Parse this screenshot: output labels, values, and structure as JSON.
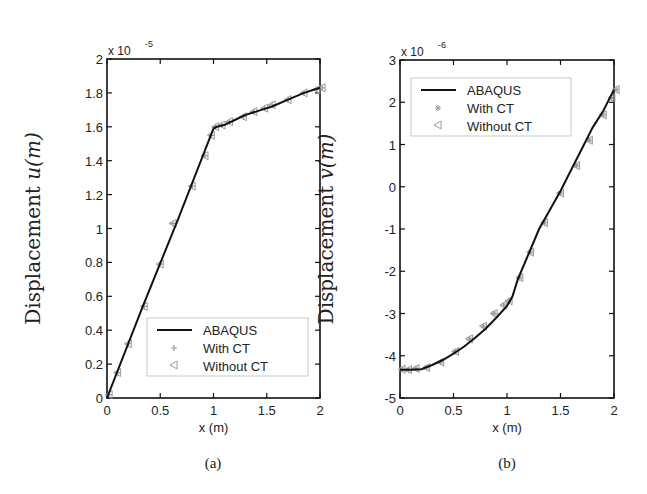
{
  "chart_data": [
    {
      "type": "line",
      "panel": "(a)",
      "title": "",
      "xlabel": "x (m)",
      "ylabel": "Displacement u(m)",
      "ylabel_text": "Displacement ",
      "ylabel_var": "u(m)",
      "y_multiplier": "x 10",
      "y_multiplier_exp": "-5",
      "xlim": [
        0,
        2
      ],
      "ylim": [
        0,
        2
      ],
      "xticks": [
        0,
        0.5,
        1,
        1.5,
        2
      ],
      "xtick_labels": [
        "0",
        "0.5",
        "1",
        "1.5",
        "2"
      ],
      "yticks": [
        0,
        0.2,
        0.4,
        0.6,
        0.8,
        1,
        1.2,
        1.4,
        1.6,
        1.8,
        2
      ],
      "ytick_labels": [
        "0",
        "0.2",
        "0.4",
        "0.6",
        "0.8",
        "1",
        "1.2",
        "1.4",
        "1.6",
        "1.8",
        "2"
      ],
      "grid": false,
      "legend_position": "lower right",
      "series": [
        {
          "name": "ABAQUS",
          "style": "solid-line",
          "x": [
            0,
            0.33,
            0.67,
            1.0,
            1.03,
            1.1,
            1.2,
            1.3,
            1.45,
            1.55,
            1.7,
            1.85,
            2.0
          ],
          "y": [
            0,
            0.53,
            1.06,
            1.59,
            1.6,
            1.61,
            1.64,
            1.67,
            1.7,
            1.72,
            1.76,
            1.8,
            1.83
          ]
        },
        {
          "name": "With CT",
          "style": "plus-marker",
          "x": [
            0.02,
            0.1,
            0.2,
            0.35,
            0.5,
            0.62,
            0.8,
            0.92,
            0.98,
            1.02,
            1.08,
            1.15,
            1.28,
            1.38,
            1.48,
            1.55,
            1.7,
            1.85,
            1.97,
            2.02
          ],
          "y": [
            0.02,
            0.15,
            0.32,
            0.54,
            0.79,
            1.03,
            1.25,
            1.43,
            1.55,
            1.6,
            1.61,
            1.63,
            1.66,
            1.69,
            1.71,
            1.73,
            1.76,
            1.8,
            1.82,
            1.83
          ]
        },
        {
          "name": "Without CT",
          "style": "triangle-left-marker",
          "x": [
            0.02,
            0.1,
            0.2,
            0.35,
            0.5,
            0.62,
            0.8,
            0.92,
            0.98,
            1.02,
            1.08,
            1.15,
            1.28,
            1.38,
            1.48,
            1.55,
            1.7,
            1.85,
            1.97,
            2.02
          ],
          "y": [
            0.02,
            0.15,
            0.32,
            0.54,
            0.79,
            1.03,
            1.25,
            1.43,
            1.55,
            1.6,
            1.61,
            1.63,
            1.66,
            1.69,
            1.71,
            1.73,
            1.76,
            1.8,
            1.82,
            1.83
          ]
        }
      ]
    },
    {
      "type": "line",
      "panel": "(b)",
      "title": "",
      "xlabel": "x (m)",
      "ylabel": "Displacement v(m)",
      "ylabel_text": "Displacement ",
      "ylabel_var": "v(m)",
      "y_multiplier": "x 10",
      "y_multiplier_exp": "-6",
      "xlim": [
        0,
        2
      ],
      "ylim": [
        -5,
        3
      ],
      "xticks": [
        0,
        0.5,
        1,
        1.5,
        2
      ],
      "xtick_labels": [
        "0",
        "0.5",
        "1",
        "1.5",
        "2"
      ],
      "yticks": [
        -5,
        -4,
        -3,
        -2,
        -1,
        0,
        1,
        2,
        3
      ],
      "ytick_labels": [
        "-5",
        "-4",
        "-3",
        "-2",
        "-1",
        "0",
        "1",
        "2",
        "3"
      ],
      "grid": false,
      "legend_position": "upper left",
      "series": [
        {
          "name": "ABAQUS",
          "style": "solid-line",
          "x": [
            0,
            0.1,
            0.2,
            0.3,
            0.4,
            0.5,
            0.6,
            0.7,
            0.8,
            0.9,
            1.0,
            1.05,
            1.1,
            1.2,
            1.3,
            1.4,
            1.5,
            1.6,
            1.7,
            1.8,
            1.9,
            2.0
          ],
          "y": [
            -4.33,
            -4.33,
            -4.32,
            -4.22,
            -4.1,
            -3.95,
            -3.78,
            -3.58,
            -3.36,
            -3.1,
            -2.82,
            -2.6,
            -2.2,
            -1.6,
            -1.0,
            -0.55,
            -0.1,
            0.4,
            0.9,
            1.4,
            1.8,
            2.3
          ]
        },
        {
          "name": "With CT",
          "style": "star-marker",
          "x": [
            0.02,
            0.08,
            0.15,
            0.25,
            0.38,
            0.52,
            0.65,
            0.78,
            0.88,
            0.97,
            1.02,
            1.12,
            1.22,
            1.35,
            1.5,
            1.65,
            1.77,
            1.9,
            1.98,
            2.02
          ],
          "y": [
            -4.32,
            -4.33,
            -4.3,
            -4.28,
            -4.15,
            -3.9,
            -3.6,
            -3.3,
            -3.0,
            -2.8,
            -2.7,
            -2.15,
            -1.55,
            -0.85,
            -0.15,
            0.5,
            1.1,
            1.7,
            2.1,
            2.3
          ]
        },
        {
          "name": "Without CT",
          "style": "triangle-left-marker",
          "x": [
            0.02,
            0.08,
            0.15,
            0.25,
            0.38,
            0.52,
            0.65,
            0.78,
            0.88,
            0.97,
            1.02,
            1.12,
            1.22,
            1.35,
            1.5,
            1.65,
            1.77,
            1.9,
            1.98,
            2.02
          ],
          "y": [
            -4.32,
            -4.33,
            -4.3,
            -4.28,
            -4.15,
            -3.9,
            -3.6,
            -3.3,
            -3.0,
            -2.8,
            -2.7,
            -2.15,
            -1.55,
            -0.85,
            -0.15,
            0.5,
            1.1,
            1.7,
            2.1,
            2.3
          ]
        }
      ]
    }
  ],
  "legend": {
    "abaqus": "ABAQUS",
    "with_ct": "With CT",
    "without_ct": "Without CT"
  },
  "captions": {
    "a": "(a)",
    "b": "(b)"
  },
  "colors": {
    "line": "#111111",
    "marker": "#9a9a9a",
    "axis": "#111111",
    "text": "#222222"
  }
}
